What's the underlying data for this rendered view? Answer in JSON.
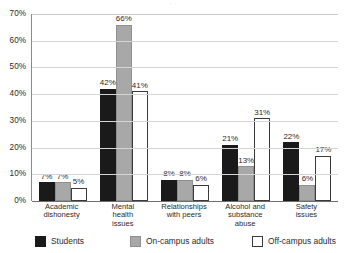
{
  "clipped_title": "· ·",
  "chart_data": {
    "type": "bar",
    "title": "",
    "xlabel": "",
    "ylabel": "",
    "ylim": [
      0,
      70
    ],
    "yticks": [
      "0%",
      "10%",
      "20%",
      "30%",
      "40%",
      "50%",
      "60%",
      "70%"
    ],
    "ytick_values": [
      0,
      10,
      20,
      30,
      40,
      50,
      60,
      70
    ],
    "grid": "horizontal",
    "legend_position": "bottom",
    "value_suffix": "%",
    "categories": [
      "Academic dishonesty",
      "Mental health issues",
      "Relationships with peers",
      "Alcohol and substance abuse",
      "Safety issues"
    ],
    "category_lines": [
      [
        "Academic",
        "dishonesty"
      ],
      [
        "Mental",
        "health",
        "issues"
      ],
      [
        "Relationships",
        "with peers"
      ],
      [
        "Alcohol and",
        "substance",
        "abuse"
      ],
      [
        "Safety",
        "issues"
      ]
    ],
    "series": [
      {
        "name": "Students",
        "color": "#1a1a1a",
        "values": [
          7,
          42,
          8,
          21,
          22
        ],
        "labels": [
          "7%",
          "42%",
          "8%",
          "21%",
          "22%"
        ]
      },
      {
        "name": "On-campus adults",
        "color": "#a8a8a8",
        "values": [
          7,
          66,
          8,
          13,
          6
        ],
        "labels": [
          "7%",
          "66%",
          "8%",
          "13%",
          "6%"
        ]
      },
      {
        "name": "Off-campus adults",
        "color": "#ffffff",
        "values": [
          5,
          41,
          6,
          31,
          17
        ],
        "labels": [
          "5%",
          "41%",
          "6%",
          "31%",
          "17%"
        ]
      }
    ]
  },
  "colors": {
    "students": "#1a1a1a",
    "on_campus_adults": "#a8a8a8",
    "off_campus_adults": "#ffffff",
    "gridline": "#d5d5d5",
    "axis": "#6e6e6e",
    "text": "#2b2b2b"
  }
}
